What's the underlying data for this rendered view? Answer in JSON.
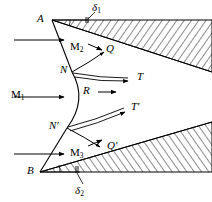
{
  "figure": {
    "background_color": "#ffffff",
    "stroke_color": "#000000",
    "width": 212,
    "height": 202
  },
  "labels": {
    "apex_upper": "A",
    "apex_lower": "B",
    "deflection_upper": "δ",
    "deflection_upper_sub": "1",
    "deflection_lower": "δ",
    "deflection_lower_sub": "2",
    "mach_freestream": "M",
    "mach_freestream_sub": "1",
    "mach_upper": "M",
    "mach_upper_sub": "2",
    "mach_lower": "M",
    "mach_lower_sub": "3",
    "triple_point_upper": "N",
    "triple_point_lower": "N′",
    "reflected_upper": "Q",
    "reflected_lower": "Q′",
    "mach_stem": "R",
    "slip_upper": "T",
    "slip_lower": "T′"
  },
  "geometry": {
    "upper_wedge": {
      "apex": [
        52,
        20
      ],
      "upper_surface_end": [
        212,
        20
      ],
      "lower_surface_end": [
        212,
        72
      ],
      "hatch_angle_deg": 35
    },
    "lower_wedge": {
      "apex": [
        40,
        172
      ],
      "lower_surface_end": [
        212,
        172
      ],
      "upper_surface_end": [
        212,
        122
      ],
      "hatch_angle_deg": 35
    },
    "incident_shock_upper": [
      [
        52,
        20
      ],
      [
        72,
        72
      ]
    ],
    "incident_shock_lower": [
      [
        40,
        172
      ],
      [
        67,
        128
      ]
    ],
    "mach_stem_curve": {
      "start": [
        72,
        72
      ],
      "control": [
        86,
        100
      ],
      "end": [
        67,
        128
      ]
    },
    "reflected_shock_upper": [
      [
        72,
        72
      ],
      [
        118,
        55
      ]
    ],
    "reflected_shock_lower": [
      [
        67,
        128
      ],
      [
        114,
        147
      ]
    ],
    "slip_line_upper": [
      [
        72,
        72
      ],
      [
        126,
        80
      ]
    ],
    "slip_line_lower": [
      [
        67,
        128
      ],
      [
        122,
        112
      ]
    ],
    "flow_arrows": [
      {
        "from": [
          14,
          40
        ],
        "to": [
          64,
          40
        ]
      },
      {
        "from": [
          14,
          97
        ],
        "to": [
          64,
          97
        ]
      },
      {
        "from": [
          14,
          154
        ],
        "to": [
          64,
          154
        ]
      }
    ],
    "mach_stem_arrow": {
      "from": [
        98,
        93
      ],
      "to": [
        118,
        93
      ]
    },
    "angle_marker_upper": {
      "vertex": [
        52,
        20
      ],
      "radius": 18
    },
    "angle_marker_lower": {
      "vertex": [
        40,
        172
      ],
      "radius": 20
    }
  },
  "label_positions": {
    "apex_upper": [
      37,
      14
    ],
    "apex_lower": [
      27,
      166
    ],
    "deflection_upper": [
      92,
      4
    ],
    "deflection_lower": [
      75,
      186
    ],
    "mach_freestream": [
      12,
      90
    ],
    "mach_upper": [
      72,
      42
    ],
    "mach_lower": [
      72,
      148
    ],
    "triple_point_upper": [
      61,
      66
    ],
    "triple_point_lower": [
      50,
      122
    ],
    "reflected_upper": [
      106,
      45
    ],
    "reflected_lower": [
      108,
      142
    ],
    "mach_stem": [
      84,
      87
    ],
    "slip_upper": [
      137,
      72
    ],
    "slip_lower": [
      132,
      103
    ]
  }
}
